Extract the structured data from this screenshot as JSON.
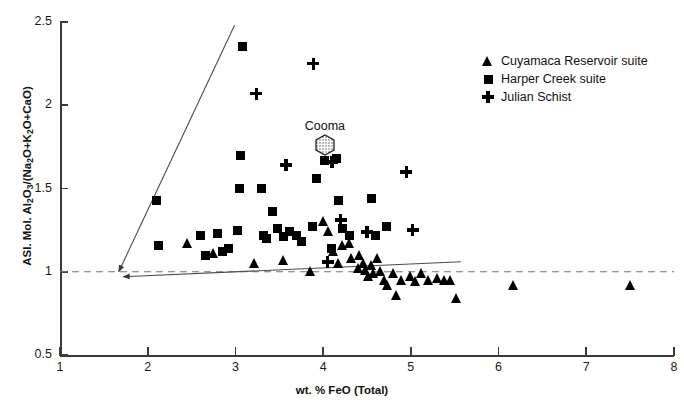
{
  "chart_data": {
    "type": "scatter",
    "title": "",
    "xlabel": "wt. % FeO (Total)",
    "ylabel": "ASI. Mol. Al2O3/(Na2O+K2O+CaO)",
    "xlim": [
      1,
      8
    ],
    "ylim": [
      0.5,
      2.5
    ],
    "xticks": [
      "1",
      "2",
      "3",
      "4",
      "5",
      "6",
      "7",
      "8"
    ],
    "yticks": [
      "2.5",
      "2",
      "1.5",
      "1",
      "0.5"
    ],
    "grid": false,
    "legend_position": "top-right",
    "series": [
      {
        "name": "Cuyamaca Reservoir suite",
        "marker": "triangle",
        "color": "#000000",
        "points": [
          [
            2.45,
            1.17
          ],
          [
            2.75,
            1.11
          ],
          [
            3.22,
            1.05
          ],
          [
            3.55,
            1.07
          ],
          [
            3.86,
            1.0
          ],
          [
            4.0,
            1.3
          ],
          [
            4.06,
            1.24
          ],
          [
            4.12,
            1.12
          ],
          [
            4.18,
            1.05
          ],
          [
            4.22,
            1.16
          ],
          [
            4.3,
            1.17
          ],
          [
            4.33,
            1.08
          ],
          [
            4.4,
            1.02
          ],
          [
            4.42,
            1.1
          ],
          [
            4.46,
            1.05
          ],
          [
            4.48,
            1.01
          ],
          [
            4.52,
            0.97
          ],
          [
            4.55,
            1.04
          ],
          [
            4.58,
            0.99
          ],
          [
            4.62,
            1.08
          ],
          [
            4.66,
            1.0
          ],
          [
            4.7,
            0.95
          ],
          [
            4.74,
            0.92
          ],
          [
            4.8,
            0.99
          ],
          [
            4.84,
            0.86
          ],
          [
            4.9,
            0.95
          ],
          [
            5.0,
            0.97
          ],
          [
            5.05,
            0.94
          ],
          [
            5.12,
            0.99
          ],
          [
            5.2,
            0.95
          ],
          [
            5.3,
            0.96
          ],
          [
            5.38,
            0.95
          ],
          [
            5.45,
            0.95
          ],
          [
            5.52,
            0.84
          ],
          [
            6.17,
            0.92
          ],
          [
            7.5,
            0.92
          ]
        ]
      },
      {
        "name": "Harper Creek suite",
        "marker": "square",
        "color": "#000000",
        "points": [
          [
            2.1,
            1.43
          ],
          [
            2.12,
            1.16
          ],
          [
            2.6,
            1.22
          ],
          [
            2.66,
            1.1
          ],
          [
            2.8,
            1.23
          ],
          [
            2.85,
            1.12
          ],
          [
            2.92,
            1.14
          ],
          [
            3.02,
            1.25
          ],
          [
            3.05,
            1.5
          ],
          [
            3.08,
            2.35
          ],
          [
            3.06,
            1.7
          ],
          [
            3.3,
            1.5
          ],
          [
            3.32,
            1.22
          ],
          [
            3.35,
            1.2
          ],
          [
            3.42,
            1.36
          ],
          [
            3.48,
            1.26
          ],
          [
            3.55,
            1.21
          ],
          [
            3.62,
            1.24
          ],
          [
            3.7,
            1.22
          ],
          [
            3.75,
            1.18
          ],
          [
            3.88,
            1.27
          ],
          [
            3.92,
            1.56
          ],
          [
            4.02,
            1.67
          ],
          [
            4.1,
            1.14
          ],
          [
            4.15,
            1.68
          ],
          [
            4.18,
            1.43
          ],
          [
            4.22,
            1.26
          ],
          [
            4.3,
            1.22
          ],
          [
            4.55,
            1.44
          ],
          [
            4.72,
            1.27
          ],
          [
            4.6,
            1.22
          ]
        ]
      },
      {
        "name": "Julian Schist",
        "marker": "plus",
        "color": "#000000",
        "points": [
          [
            3.24,
            2.07
          ],
          [
            3.89,
            2.25
          ],
          [
            3.58,
            1.64
          ],
          [
            4.1,
            1.66
          ],
          [
            4.2,
            1.31
          ],
          [
            4.5,
            1.24
          ],
          [
            5.02,
            1.25
          ],
          [
            4.95,
            1.6
          ],
          [
            4.05,
            1.06
          ]
        ]
      }
    ],
    "annotations": [
      {
        "label": "Cooma",
        "symbol": "hexagon-stippled",
        "x": 4.02,
        "y": 1.75
      }
    ],
    "reference_lines": [
      {
        "name": "asi-unity-dashed",
        "style": "dashed",
        "y": 1.0,
        "x_from": 1.0,
        "x_to": 8.0
      },
      {
        "name": "steep-trend-arrow",
        "style": "solid-arrow",
        "x_from": 2.99,
        "y_from": 2.48,
        "x_to": 1.67,
        "y_to": 1.0
      },
      {
        "name": "shallow-trend-arrow",
        "style": "solid-arrow",
        "x_from": 5.57,
        "y_from": 1.06,
        "x_to": 1.72,
        "y_to": 0.97
      }
    ]
  },
  "axis": {
    "x_title": "wt. % FeO (Total)",
    "y_title_prefix": "ASI. Mol. Al",
    "y_title_s1": "2",
    "y_title_mid": "O",
    "y_title_s2": "3",
    "y_title_slash": "/(Na",
    "y_title_s3": "2",
    "y_title_o2": "O+K",
    "y_title_s4": "2",
    "y_title_tail": "O+CaO)"
  },
  "legend": {
    "entries": [
      {
        "label": "Cuyamaca Reservoir suite",
        "marker": "triangle"
      },
      {
        "label": "Harper Creek suite",
        "marker": "square"
      },
      {
        "label": "Julian Schist",
        "marker": "plus"
      }
    ]
  },
  "cooma": {
    "label": "Cooma"
  }
}
